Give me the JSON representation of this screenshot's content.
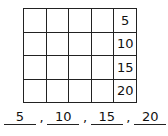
{
  "grid": {
    "rows": 4,
    "columns": 5,
    "last_column_values": [
      "5",
      "10",
      "15",
      "20"
    ]
  },
  "answers": {
    "values": [
      "5",
      "10",
      "15",
      "20"
    ],
    "separator": ","
  }
}
